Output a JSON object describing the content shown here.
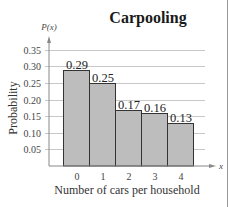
{
  "chart_data": {
    "type": "bar",
    "title": "Carpooling",
    "xlabel": "Number of cars per household",
    "ylabel": "Probability",
    "x_axis_symbol": "x",
    "y_axis_symbol": "P(x)",
    "categories": [
      "0",
      "1",
      "2",
      "3",
      "4"
    ],
    "values": [
      0.29,
      0.25,
      0.17,
      0.16,
      0.13
    ],
    "value_labels": [
      "0.29",
      "0.25",
      "0.17",
      "0.16",
      "0.13"
    ],
    "yticks": [
      "0.05",
      "0.10",
      "0.15",
      "0.20",
      "0.25",
      "0.30",
      "0.35"
    ],
    "ylim": [
      0,
      0.35
    ],
    "grid": true,
    "legend": null,
    "bar_color": "#bdbdbd",
    "bar_edge_color": "#333333",
    "grid_color": "#c8c8c8"
  }
}
